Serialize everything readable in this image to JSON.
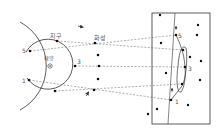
{
  "labels": {
    "sun": "태양",
    "earth": "지구",
    "mars": "화성"
  },
  "colors": {
    "line": "#333333",
    "dash": "#777777",
    "text": "#555555",
    "star": "#111111"
  },
  "sun": {
    "x": 50,
    "y": 66
  },
  "earth_orbit": {
    "cx": 50,
    "cy": 66,
    "r": 25
  },
  "mars_orbit": {
    "cx": 48,
    "cy": 66,
    "r": 50
  },
  "earth_positions": [
    {
      "n": "1",
      "x": 29,
      "y": 80
    },
    {
      "n": "2",
      "x": 55,
      "y": 91
    },
    {
      "n": "3",
      "x": 75,
      "y": 66
    },
    {
      "n": "4",
      "x": 57,
      "y": 41
    },
    {
      "n": "5",
      "x": 30,
      "y": 51
    }
  ],
  "mars_positions": [
    {
      "n": "1",
      "x": 94,
      "y": 90
    },
    {
      "n": "2",
      "x": 98,
      "y": 79
    },
    {
      "n": "3",
      "x": 99,
      "y": 66
    },
    {
      "n": "4",
      "x": 98,
      "y": 55
    },
    {
      "n": "5",
      "x": 95,
      "y": 43
    }
  ],
  "sky_positions": [
    {
      "n": "1",
      "x": 171,
      "y": 100
    },
    {
      "n": "2",
      "x": 182,
      "y": 84
    },
    {
      "n": "3",
      "x": 185,
      "y": 67
    },
    {
      "n": "4",
      "x": 183,
      "y": 50
    },
    {
      "n": "5",
      "x": 176,
      "y": 35
    }
  ],
  "number_labels": {
    "earth_5": "5",
    "earth_3": "3",
    "earth_1": "1",
    "sky_5": "5",
    "sky_3": "3",
    "sky_1": "1"
  },
  "sky_box": {
    "x": 152,
    "y": 13,
    "w": 58,
    "h": 111
  },
  "stars": [
    {
      "x": 160,
      "y": 15
    },
    {
      "x": 198,
      "y": 25
    },
    {
      "x": 197,
      "y": 35
    },
    {
      "x": 161,
      "y": 43
    },
    {
      "x": 190,
      "y": 57
    },
    {
      "x": 201,
      "y": 61
    },
    {
      "x": 166,
      "y": 73
    },
    {
      "x": 200,
      "y": 80
    },
    {
      "x": 157,
      "y": 109
    },
    {
      "x": 188,
      "y": 105
    },
    {
      "x": 148,
      "y": 114
    }
  ]
}
